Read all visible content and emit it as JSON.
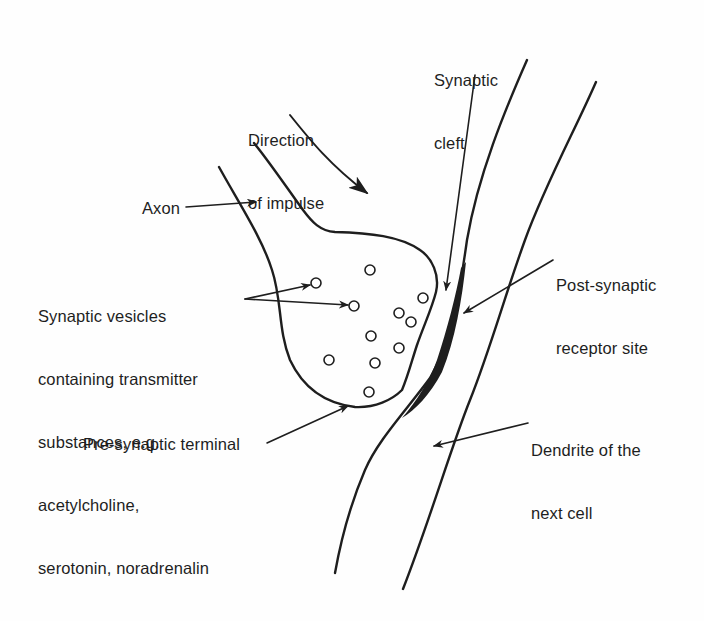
{
  "diagram": {
    "colors": {
      "ink": "#1e1e1e",
      "background": "#fefefe"
    },
    "labels": {
      "direction_of_impulse": [
        "Direction",
        "of impulse"
      ],
      "synaptic_cleft": [
        "Synaptic",
        "cleft"
      ],
      "axon": "Axon",
      "synaptic_vesicles": [
        "Synaptic vesicles",
        "containing transmitter",
        "substances, e.g.",
        "acetylcholine,",
        "serotonin, noradrenalin"
      ],
      "post_synaptic_receptor_site": [
        "Post-synaptic",
        "receptor site"
      ],
      "dendrite": [
        "Dendrite of the",
        "next cell"
      ],
      "pre_synaptic_terminal": "Pre-synaptic terminal"
    },
    "vesicle_count": 11
  }
}
